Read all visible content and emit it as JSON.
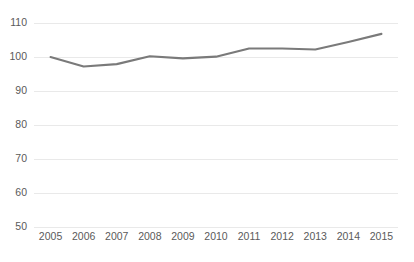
{
  "chart_data": {
    "type": "line",
    "title": "",
    "subtitle": "",
    "xlabel": "",
    "ylabel": "",
    "categories": [
      "2005",
      "2006",
      "2007",
      "2008",
      "2009",
      "2010",
      "2011",
      "2012",
      "2013",
      "2014",
      "2015"
    ],
    "x": [
      2005,
      2006,
      2007,
      2008,
      2009,
      2010,
      2011,
      2012,
      2013,
      2014,
      2015
    ],
    "values": [
      100.0,
      97.2,
      97.9,
      100.2,
      99.6,
      100.1,
      102.5,
      102.5,
      102.2,
      104.4,
      106.8
    ],
    "series": [
      {
        "name": "",
        "color": "#7a7a7a",
        "values": [
          100.0,
          97.2,
          97.9,
          100.2,
          99.6,
          100.1,
          102.5,
          102.5,
          102.2,
          104.4,
          106.8
        ]
      }
    ],
    "ylim": [
      50,
      110
    ],
    "ytick_values": [
      110,
      100,
      90,
      80,
      70,
      60,
      50
    ],
    "ytick_labels": [
      "110",
      "100",
      "90",
      "80",
      "70",
      "60",
      "50"
    ],
    "xtick_labels": [
      "2005",
      "2006",
      "2007",
      "2008",
      "2009",
      "2010",
      "2011",
      "2012",
      "2013",
      "2014",
      "2015"
    ],
    "grid": true,
    "grid_axis": "y",
    "grid_color": "#e9e9e9",
    "legend": false,
    "legend_position": "none",
    "markers": false,
    "annotations": [],
    "background_color": "#ffffff",
    "axis_label_color": "#5a5a5a"
  },
  "layout": {
    "plot_left": 34,
    "plot_right": 398,
    "plot_top": 23,
    "plot_bottom": 227,
    "xlabel_baseline_y": 232
  }
}
